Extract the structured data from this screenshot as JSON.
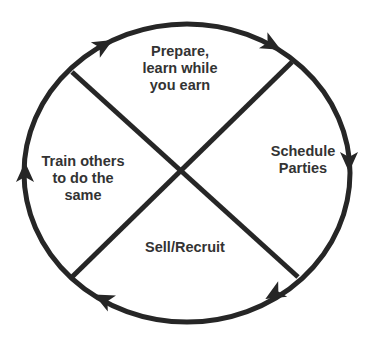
{
  "diagram": {
    "type": "cycle",
    "direction": "clockwise",
    "stroke_color": "#262626",
    "text_color": "#333333",
    "sections": {
      "top": "Prepare,\nlearn while\nyou earn",
      "right": "Schedule\nParties",
      "bottom": "Sell/Recruit",
      "left": "Train others\nto do the\nsame"
    },
    "arrows": [
      {
        "name": "arrow-top-left",
        "direction": "clockwise"
      },
      {
        "name": "arrow-top-right",
        "direction": "clockwise"
      },
      {
        "name": "arrow-right",
        "direction": "clockwise"
      },
      {
        "name": "arrow-bottom-right",
        "direction": "clockwise"
      },
      {
        "name": "arrow-bottom-left",
        "direction": "clockwise"
      },
      {
        "name": "arrow-left",
        "direction": "clockwise"
      }
    ]
  }
}
